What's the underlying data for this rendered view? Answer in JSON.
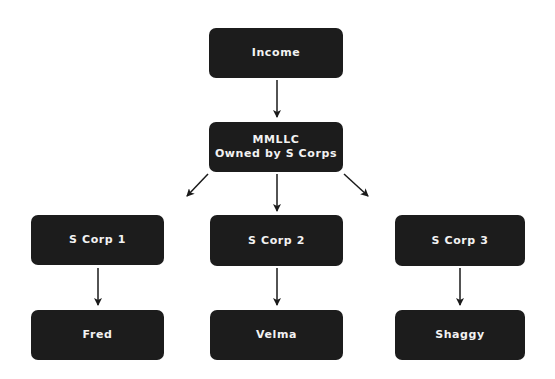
{
  "diagram": {
    "type": "org-chart",
    "nodes": [
      {
        "id": "income",
        "label": "Income"
      },
      {
        "id": "mmllc",
        "line1": "MMLLC",
        "line2": "Owned by S Corps"
      },
      {
        "id": "scorp1",
        "label": "S Corp 1"
      },
      {
        "id": "scorp2",
        "label": "S Corp 2"
      },
      {
        "id": "scorp3",
        "label": "S Corp 3"
      },
      {
        "id": "fred",
        "label": "Fred"
      },
      {
        "id": "velma",
        "label": "Velma"
      },
      {
        "id": "shaggy",
        "label": "Shaggy"
      }
    ],
    "edges": [
      {
        "from": "income",
        "to": "mmllc"
      },
      {
        "from": "mmllc",
        "to": "scorp1"
      },
      {
        "from": "mmllc",
        "to": "scorp2"
      },
      {
        "from": "mmllc",
        "to": "scorp3"
      },
      {
        "from": "scorp1",
        "to": "fred"
      },
      {
        "from": "scorp2",
        "to": "velma"
      },
      {
        "from": "scorp3",
        "to": "shaggy"
      }
    ],
    "colors": {
      "node_fill": "#1c1c1c",
      "node_text": "#f2f2f2",
      "arrow": "#1a1a1a",
      "background": "#ffffff"
    }
  }
}
